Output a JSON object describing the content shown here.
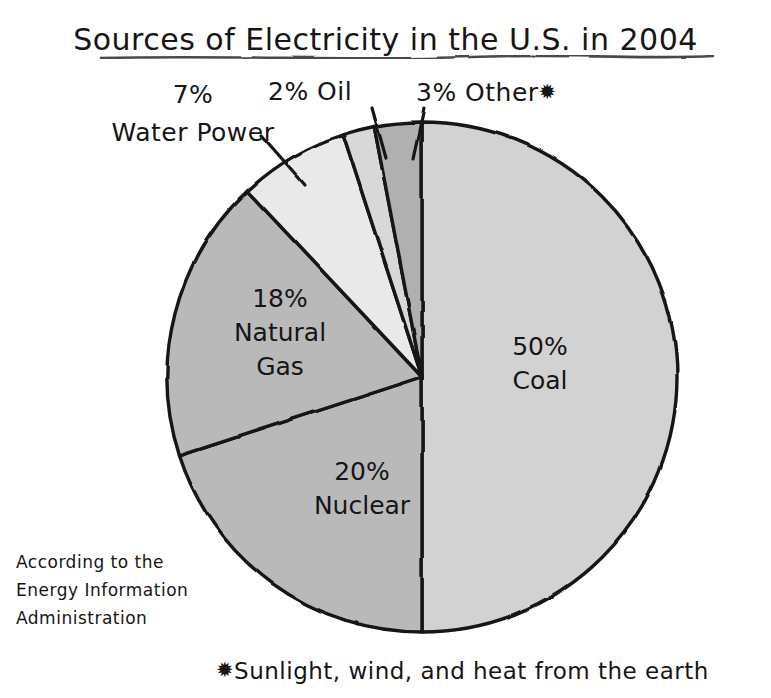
{
  "chart_data": {
    "type": "pie",
    "title": "Sources of Electricity in the U.S. in 2004",
    "categories": [
      "Coal",
      "Nuclear",
      "Natural Gas",
      "Water Power",
      "Oil",
      "Other"
    ],
    "values": [
      50,
      20,
      18,
      7,
      2,
      3
    ],
    "unit": "%",
    "legend": "none",
    "labels_inline": true,
    "slices": [
      {
        "name": "Coal",
        "value": 50,
        "label": "50%\nCoal",
        "color": "#d2d2d2",
        "label_placement": "inside"
      },
      {
        "name": "Nuclear",
        "value": 20,
        "label": "20%\nNuclear",
        "color": "#b9b9b9",
        "label_placement": "inside"
      },
      {
        "name": "Natural Gas",
        "value": 18,
        "label": "18%\nNatural\nGas",
        "color": "#b9b9b9",
        "label_placement": "inside"
      },
      {
        "name": "Water Power",
        "value": 7,
        "label": "7%\nWater Power",
        "color": "#e9e9e9",
        "label_placement": "outside-leader"
      },
      {
        "name": "Oil",
        "value": 2,
        "label": "2% Oil",
        "color": "#d8d8d8",
        "label_placement": "outside-leader"
      },
      {
        "name": "Other",
        "value": 3,
        "label": "3% Other",
        "color": "#b0b0b0",
        "label_placement": "outside-leader"
      }
    ],
    "annotations": [
      "According to the Energy Information Administration",
      "Sunlight, wind, and heat from the earth"
    ]
  },
  "title": {
    "text": "Sources of Electricity in the U.S. in 2004"
  },
  "callouts": {
    "water_power": {
      "percent": "7%",
      "name": "Water Power"
    },
    "oil": {
      "text": "2% Oil"
    },
    "other": {
      "text": "3% Other",
      "marker": "✹"
    }
  },
  "slice_labels": {
    "coal": {
      "percent": "50%",
      "name": "Coal"
    },
    "gas": {
      "percent": "18%",
      "name_line1": "Natural",
      "name_line2": "Gas"
    },
    "nuclear": {
      "percent": "20%",
      "name": "Nuclear"
    }
  },
  "source_note": {
    "line1": "According to the",
    "line2": "Energy Information",
    "line3": "Administration"
  },
  "footnote": {
    "marker": "✹",
    "text": "Sunlight, wind, and heat from the earth"
  },
  "colors": {
    "ink": "#161616",
    "paper": "#ffffff",
    "coal": "#d2d2d2",
    "nuclear": "#b9b9b9",
    "natural_gas": "#b9b9b9",
    "water_power": "#e9e9e9",
    "oil": "#d8d8d8",
    "other": "#b0b0b0"
  }
}
